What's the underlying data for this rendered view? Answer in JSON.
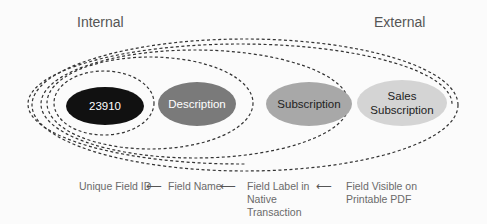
{
  "regions": {
    "internal_label": "Internal",
    "external_label": "External"
  },
  "nodes": [
    {
      "label": "23910",
      "fill": "#111111",
      "text_color": "#ffffff"
    },
    {
      "label": "Description",
      "fill": "#7a7a7a",
      "text_color": "#ffffff"
    },
    {
      "label": "Subscription",
      "fill": "#a8a8a8",
      "text_color": "#222222"
    },
    {
      "label": "Sales Subscription",
      "line1": "Sales",
      "line2": "Subscription",
      "fill": "#d4d4d4",
      "text_color": "#222222"
    }
  ],
  "captions": [
    {
      "label": "Unique Field ID"
    },
    {
      "label": "Field Name"
    },
    {
      "label": "Field Label in Native Transaction",
      "line1": "Field Label in",
      "line2": "Native",
      "line3": "Transaction"
    },
    {
      "label": "Field Visible on Printable PDF",
      "line1": "Field Visible on",
      "line2": "Printable PDF"
    }
  ],
  "arrows": [
    {
      "glyph": "⟵"
    },
    {
      "glyph": "⟵"
    },
    {
      "glyph": "⟵"
    }
  ]
}
